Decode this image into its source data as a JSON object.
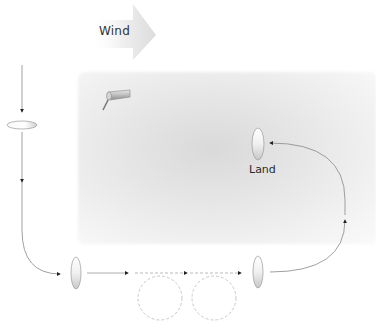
{
  "diagram": {
    "wind": {
      "label": "Wind",
      "direction": "right"
    },
    "land_area": {
      "label": "Land",
      "fill": "#e2e2e2"
    },
    "icons": {
      "windsock": "windsock-icon",
      "aircraft": "aircraft-ellipse-icon"
    },
    "path_segments": [
      {
        "name": "descent-leg",
        "style": "solid"
      },
      {
        "name": "base-turn",
        "style": "solid"
      },
      {
        "name": "circle-1",
        "style": "dashed"
      },
      {
        "name": "circle-2",
        "style": "dashed"
      },
      {
        "name": "final-approach",
        "style": "solid"
      }
    ],
    "colors": {
      "line": "#7a7a7a",
      "dashed": "#b0b0b0",
      "arrowhead": "#222222",
      "text": "#333333",
      "wind_arrow": "#e8e8e8"
    }
  }
}
